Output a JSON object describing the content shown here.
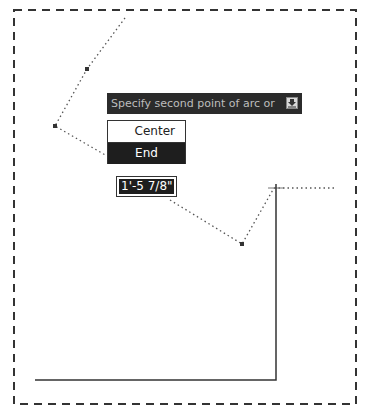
{
  "tooltip": {
    "prompt": "Specify second point of arc or",
    "dropdown_icon": "down-arrow-icon"
  },
  "menu": {
    "items": [
      {
        "label": "Center",
        "selected": false
      },
      {
        "label": "End",
        "selected": true
      }
    ]
  },
  "dimension_input": {
    "value": "1'-5 7/8\""
  },
  "colors": {
    "tooltip_bg": "#2b2b2b",
    "tooltip_text": "#bdbdbd",
    "selection_bg": "#1e1e1e",
    "lines": "#333333"
  }
}
